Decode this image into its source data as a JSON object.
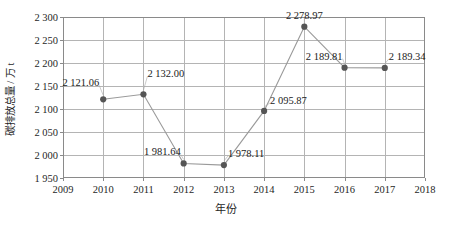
{
  "chart_data": {
    "type": "line",
    "title": "",
    "xlabel": "年份",
    "ylabel": "碳排放总量 / 万 t",
    "x": [
      2010,
      2011,
      2012,
      2013,
      2014,
      2015,
      2016,
      2017
    ],
    "values": [
      2121.06,
      2132.0,
      1981.64,
      1978.11,
      2095.87,
      2278.97,
      2189.81,
      2189.34
    ],
    "point_labels": [
      "2 121.06",
      "2 132.00",
      "1 981.64",
      "1 978.11",
      "2 095.87",
      "2 278.97",
      "2 189.81",
      "2 189.34"
    ],
    "xlim": [
      2009,
      2018
    ],
    "ylim": [
      1950,
      2300
    ],
    "xticks": [
      2009,
      2010,
      2011,
      2012,
      2013,
      2014,
      2015,
      2016,
      2017,
      2018
    ],
    "xtick_labels": [
      "2009",
      "2010",
      "2011",
      "2012",
      "2013",
      "2014",
      "2015",
      "2016",
      "2017",
      "2018"
    ],
    "yticks": [
      1950,
      2000,
      2050,
      2100,
      2150,
      2200,
      2250,
      2300
    ],
    "ytick_labels": [
      "1 950",
      "2 000",
      "2 050",
      "2 100",
      "2 150",
      "2 200",
      "2 250",
      "2 300"
    ],
    "grid": "both",
    "legend": "none",
    "series_color": "#9a9a9a",
    "marker_color": "#555555",
    "axis_color": "#8a8a8a",
    "grid_color": "#b4b4b4"
  }
}
